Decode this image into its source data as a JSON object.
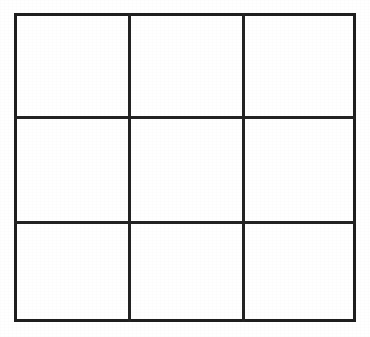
{
  "figure": {
    "name": "3x3-grid",
    "type": "grid",
    "rows": 3,
    "columns": 3,
    "cell_count": 9,
    "cells_empty": true,
    "bounds": {
      "x": 14,
      "y": 13,
      "width": 342,
      "height": 309
    },
    "vertical_divider_x": [
      128,
      242
    ],
    "horizontal_divider_y": [
      116,
      221
    ],
    "column_edges_x": [
      14,
      128,
      242,
      356
    ],
    "row_edges_y": [
      13,
      116,
      221,
      322
    ],
    "line_width_px": 3,
    "outer_border_width_px": 3
  },
  "colors": {
    "page_background": "#ffffff",
    "cell_background": "#ffffff",
    "line": "#232323",
    "outer_border": "#1f1f1f"
  },
  "cells": [
    {
      "id": "cell-r1c1",
      "row": 1,
      "column": 1,
      "value": ""
    },
    {
      "id": "cell-r1c2",
      "row": 1,
      "column": 2,
      "value": ""
    },
    {
      "id": "cell-r1c3",
      "row": 1,
      "column": 3,
      "value": ""
    },
    {
      "id": "cell-r2c1",
      "row": 2,
      "column": 1,
      "value": ""
    },
    {
      "id": "cell-r2c2",
      "row": 2,
      "column": 2,
      "value": ""
    },
    {
      "id": "cell-r2c3",
      "row": 2,
      "column": 3,
      "value": ""
    },
    {
      "id": "cell-r3c1",
      "row": 3,
      "column": 1,
      "value": ""
    },
    {
      "id": "cell-r3c2",
      "row": 3,
      "column": 2,
      "value": ""
    },
    {
      "id": "cell-r3c3",
      "row": 3,
      "column": 3,
      "value": ""
    }
  ]
}
